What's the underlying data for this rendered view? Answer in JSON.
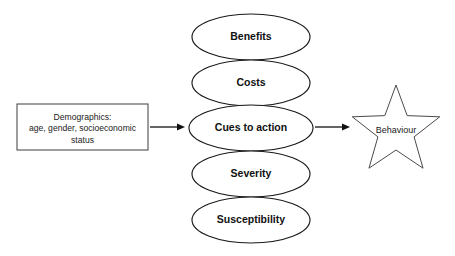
{
  "diagram": {
    "background_color": "#ffffff",
    "outline_color": "#1a1a1a",
    "text_color": "#111111",
    "ellipse_nodes": [
      {
        "id": "benefits",
        "label": "Benefits",
        "cx": 251,
        "cy": 37,
        "rx": 59,
        "ry": 23
      },
      {
        "id": "costs",
        "label": "Costs",
        "cx": 251,
        "cy": 83,
        "rx": 59,
        "ry": 23
      },
      {
        "id": "cues-to-action",
        "label": "Cues to action",
        "cx": 251,
        "cy": 128,
        "rx": 62,
        "ry": 23
      },
      {
        "id": "severity",
        "label": "Severity",
        "cx": 251,
        "cy": 174,
        "rx": 59,
        "ry": 23
      },
      {
        "id": "susceptibility",
        "label": "Susceptibility",
        "cx": 251,
        "cy": 220,
        "rx": 59,
        "ry": 23
      }
    ],
    "demographics_box": {
      "id": "demographics",
      "lines": [
        "Demographics:",
        "age, gender, socioeconomic",
        "status"
      ],
      "x": 17,
      "y": 104,
      "width": 131,
      "height": 46
    },
    "outcome_star": {
      "id": "behaviour",
      "label": "Behaviour",
      "cx": 396,
      "cy": 131,
      "outer_radius": 46,
      "inner_radius": 19,
      "points": 5
    },
    "arrows": [
      {
        "id": "demographics-to-cues",
        "x1": 150,
        "y1": 127,
        "x2": 185,
        "y2": 127
      },
      {
        "id": "cues-to-behaviour",
        "x1": 315,
        "y1": 127,
        "x2": 350,
        "y2": 127
      }
    ]
  }
}
